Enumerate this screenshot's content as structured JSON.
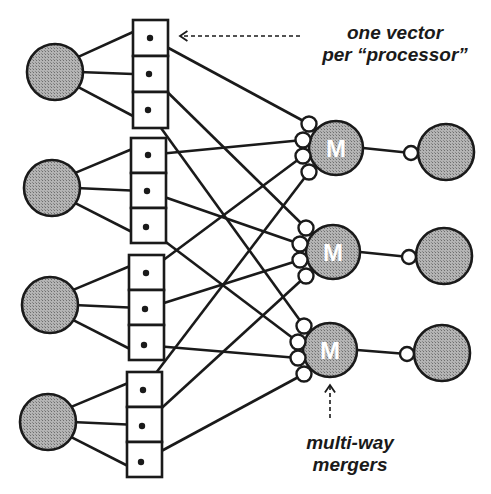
{
  "annotations": {
    "top_line1": "one vector",
    "top_line2": "per “processor”",
    "bottom_line1": "multi-way",
    "bottom_line2": "mergers"
  },
  "merger_letter": "M",
  "colors": {
    "stroke": "#1a1a1a",
    "node_fill": "#a8a8a8",
    "background": "#ffffff"
  },
  "diagram": {
    "processors": [
      {
        "id": "P1",
        "cx": 55,
        "cy": 72,
        "r": 28
      },
      {
        "id": "P2",
        "cx": 52,
        "cy": 188,
        "r": 28
      },
      {
        "id": "P3",
        "cx": 50,
        "cy": 305,
        "r": 28
      },
      {
        "id": "P4",
        "cx": 48,
        "cy": 422,
        "r": 28
      }
    ],
    "vector_groups": [
      {
        "x": 133,
        "y": 20,
        "w": 35,
        "cell_h": 36,
        "dots": [
          [
            150,
            38
          ],
          [
            149,
            74
          ],
          [
            148,
            110
          ]
        ]
      },
      {
        "x": 131,
        "y": 138,
        "w": 35,
        "cell_h": 35,
        "dots": [
          [
            148,
            155
          ],
          [
            147,
            191
          ],
          [
            146,
            227
          ]
        ]
      },
      {
        "x": 129,
        "y": 255,
        "w": 35,
        "cell_h": 35,
        "dots": [
          [
            146,
            273
          ],
          [
            145,
            309
          ],
          [
            144,
            345
          ]
        ]
      },
      {
        "x": 127,
        "y": 372,
        "w": 35,
        "cell_h": 35,
        "dots": [
          [
            143,
            390
          ],
          [
            142,
            426
          ],
          [
            141,
            462
          ]
        ]
      }
    ],
    "mergers": [
      {
        "id": "M1",
        "cx": 336,
        "cy": 148,
        "r": 27,
        "ports": [
          [
            309,
            124
          ],
          [
            303,
            140
          ],
          [
            303,
            156
          ],
          [
            309,
            172
          ]
        ]
      },
      {
        "id": "M2",
        "cx": 333,
        "cy": 252,
        "r": 27,
        "ports": [
          [
            306,
            228
          ],
          [
            300,
            244
          ],
          [
            300,
            260
          ],
          [
            306,
            276
          ]
        ]
      },
      {
        "id": "M3",
        "cx": 330,
        "cy": 350,
        "r": 27,
        "ports": [
          [
            304,
            326
          ],
          [
            298,
            342
          ],
          [
            298,
            358
          ],
          [
            304,
            374
          ]
        ]
      }
    ],
    "outputs": [
      {
        "id": "O1",
        "cx": 446,
        "cy": 152,
        "r": 28,
        "port": [
          411,
          153
        ]
      },
      {
        "id": "O2",
        "cx": 444,
        "cy": 256,
        "r": 28,
        "port": [
          409,
          257
        ]
      },
      {
        "id": "O3",
        "cx": 442,
        "cy": 353,
        "r": 28,
        "port": [
          407,
          354
        ]
      }
    ],
    "connections": [
      {
        "group": 0,
        "dot": 0,
        "merger": 0,
        "port": 0
      },
      {
        "group": 0,
        "dot": 1,
        "merger": 1,
        "port": 0
      },
      {
        "group": 0,
        "dot": 2,
        "merger": 2,
        "port": 0
      },
      {
        "group": 1,
        "dot": 0,
        "merger": 0,
        "port": 1
      },
      {
        "group": 1,
        "dot": 1,
        "merger": 1,
        "port": 1
      },
      {
        "group": 1,
        "dot": 2,
        "merger": 2,
        "port": 1
      },
      {
        "group": 2,
        "dot": 0,
        "merger": 0,
        "port": 2
      },
      {
        "group": 2,
        "dot": 1,
        "merger": 1,
        "port": 2
      },
      {
        "group": 2,
        "dot": 2,
        "merger": 2,
        "port": 2
      },
      {
        "group": 3,
        "dot": 0,
        "merger": 0,
        "port": 3
      },
      {
        "group": 3,
        "dot": 1,
        "merger": 1,
        "port": 3
      },
      {
        "group": 3,
        "dot": 2,
        "merger": 2,
        "port": 3
      }
    ],
    "top_arrow": {
      "from": [
        300,
        36
      ],
      "to": [
        180,
        36
      ],
      "dashed": true
    },
    "bottom_arrow": {
      "from": [
        330,
        418
      ],
      "to": [
        330,
        385
      ],
      "dashed": true
    }
  }
}
